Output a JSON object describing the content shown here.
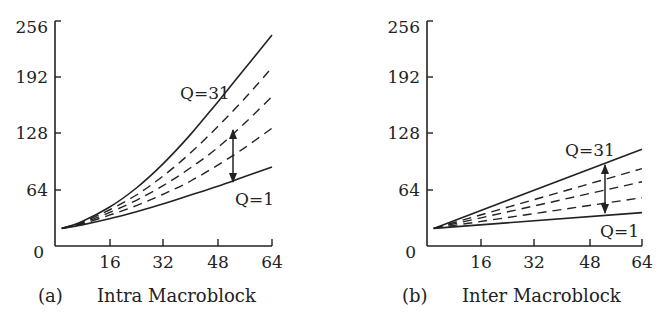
{
  "chart_data": [
    {
      "type": "line",
      "title": "(a) Intra Macroblock",
      "caption_prefix": "(a)",
      "caption_text": "Intra Macroblock",
      "xlabel": "",
      "ylabel": "",
      "xlim": [
        0,
        64
      ],
      "ylim": [
        0,
        256
      ],
      "xticks": [
        16,
        32,
        48,
        64
      ],
      "yticks": [
        0,
        64,
        128,
        192,
        256
      ],
      "grid": false,
      "x": [
        2,
        8,
        16,
        24,
        32,
        40,
        48,
        56,
        64
      ],
      "series": [
        {
          "name": "Q=31",
          "style": "solid",
          "values": [
            20,
            28,
            44,
            66,
            94,
            127,
            164,
            202,
            240
          ]
        },
        {
          "name": "Q intermediate 1",
          "style": "dashed",
          "values": [
            20,
            27,
            41,
            58,
            80,
            106,
            136,
            168,
            203
          ]
        },
        {
          "name": "Q intermediate 2",
          "style": "dashed",
          "values": [
            20,
            26,
            38,
            52,
            69,
            89,
            112,
            140,
            170
          ]
        },
        {
          "name": "Q intermediate 3",
          "style": "dashed",
          "values": [
            20,
            25,
            35,
            46,
            59,
            74,
            92,
            112,
            134
          ]
        },
        {
          "name": "Q=1",
          "style": "solid",
          "values": [
            20,
            24,
            31,
            39,
            48,
            58,
            68,
            79,
            90
          ]
        }
      ],
      "annotations": [
        {
          "text": "Q=31",
          "x": 44,
          "y": 170
        },
        {
          "text": "Q=1",
          "x": 53,
          "y": 58
        },
        {
          "text": "double-arrow",
          "x": 52,
          "y_from": 165,
          "y_to": 78
        }
      ]
    },
    {
      "type": "line",
      "title": "(b) Inter Macroblock",
      "caption_prefix": "(b)",
      "caption_text": "Inter Macroblock",
      "xlabel": "",
      "ylabel": "",
      "xlim": [
        0,
        64
      ],
      "ylim": [
        0,
        256
      ],
      "xticks": [
        16,
        32,
        48,
        64
      ],
      "yticks": [
        0,
        64,
        128,
        192,
        256
      ],
      "grid": false,
      "x": [
        2,
        64
      ],
      "series": [
        {
          "name": "Q=31",
          "style": "solid",
          "values": [
            20,
            110
          ]
        },
        {
          "name": "Q intermediate 1",
          "style": "dashed",
          "values": [
            20,
            88
          ]
        },
        {
          "name": "Q intermediate 2",
          "style": "dashed",
          "values": [
            20,
            73
          ]
        },
        {
          "name": "Q intermediate 3",
          "style": "dashed",
          "values": [
            20,
            55
          ]
        },
        {
          "name": "Q=1",
          "style": "solid",
          "values": [
            20,
            38
          ]
        }
      ],
      "annotations": [
        {
          "text": "Q=31",
          "x": 42,
          "y": 112
        },
        {
          "text": "Q=1",
          "x": 52,
          "y": 20
        },
        {
          "text": "double-arrow",
          "x": 52,
          "y_from": 90,
          "y_to": 40
        }
      ]
    }
  ],
  "labels": {
    "y_ticks": [
      "0",
      "64",
      "128",
      "192",
      "256"
    ],
    "x_ticks": [
      "16",
      "32",
      "48",
      "64"
    ],
    "left": {
      "caption_prefix": "(a)",
      "caption_text": "Intra Macroblock",
      "q_high": "Q=31",
      "q_low": "Q=1"
    },
    "right": {
      "caption_prefix": "(b)",
      "caption_text": "Inter Macroblock",
      "q_high": "Q=31",
      "q_low": "Q=1"
    }
  }
}
